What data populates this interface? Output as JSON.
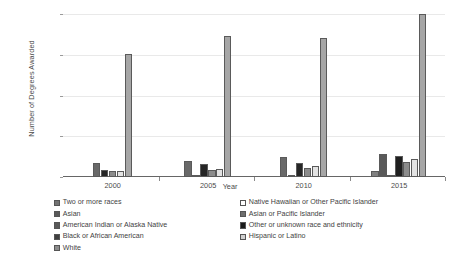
{
  "chart_data": {
    "type": "bar",
    "title": "",
    "subtitle": "",
    "xlabel": "Year",
    "ylabel": "Number of Degrees Awarded",
    "categories": [
      "2000",
      "2005",
      "2010",
      "2015"
    ],
    "ylim": [
      0,
      20000
    ],
    "yticks": [
      0,
      5000,
      10000,
      15000,
      20000
    ],
    "ytick_labels": [
      "0",
      "5,000",
      "10,000",
      "15,000",
      "20,000"
    ],
    "grid": true,
    "legend_position": "bottom",
    "series": [
      {
        "name": "Two or more races",
        "color": "#808080",
        "values": [
          0,
          0,
          0,
          700
        ]
      },
      {
        "name": "Asian",
        "color": "#696969",
        "values": [
          1700,
          1950,
          2400,
          2850
        ]
      },
      {
        "name": "American Indian or Alaska Native",
        "color": "#d9d9d9",
        "values": [
          120,
          130,
          150,
          200
        ]
      },
      {
        "name": "Black or African American",
        "color": "#1a1a1a",
        "values": [
          850,
          1550,
          1700,
          2600
        ]
      },
      {
        "name": "White",
        "color": "#a6a6a6",
        "values": [
          15100,
          17300,
          17000,
          19950
        ]
      },
      {
        "name": "Native Hawaiian or Other Pacific Islander",
        "color": "#ffffff",
        "values": [
          0,
          0,
          0,
          0
        ]
      },
      {
        "name": "Asian or Pacific Islander",
        "color": "#8c8c8c",
        "values": [
          750,
          900,
          1150,
          1900
        ]
      },
      {
        "name": "Other or unknown race and ethnicity",
        "color": "#1a1a1a",
        "values": [
          0,
          0,
          0,
          0
        ]
      },
      {
        "name": "Hispanic or Latino",
        "color": "#e8e8e8",
        "values": [
          700,
          1000,
          1400,
          2150
        ]
      }
    ],
    "group_bars": [
      {
        "year": "2000",
        "bars": [
          {
            "series": "Asian",
            "value": 1700,
            "color": "#696969"
          },
          {
            "series": "Black or African American",
            "value": 850,
            "color": "#262626"
          },
          {
            "series": "Asian or Pacific Islander",
            "value": 750,
            "color": "#8c8c8c"
          },
          {
            "series": "Hispanic or Latino",
            "value": 700,
            "color": "#e3e3e3"
          },
          {
            "series": "White",
            "value": 15100,
            "color": "#a6a6a6"
          }
        ]
      },
      {
        "year": "2005",
        "bars": [
          {
            "series": "Asian",
            "value": 1950,
            "color": "#696969"
          },
          {
            "series": "American Indian or Alaska Native",
            "value": 130,
            "color": "#d9d9d9"
          },
          {
            "series": "Black or African American",
            "value": 1550,
            "color": "#262626"
          },
          {
            "series": "Asian or Pacific Islander",
            "value": 900,
            "color": "#8c8c8c"
          },
          {
            "series": "Hispanic or Latino",
            "value": 1000,
            "color": "#e3e3e3"
          },
          {
            "series": "White",
            "value": 17300,
            "color": "#a6a6a6"
          }
        ]
      },
      {
        "year": "2010",
        "bars": [
          {
            "series": "Asian",
            "value": 2400,
            "color": "#696969"
          },
          {
            "series": "American Indian or Alaska Native",
            "value": 150,
            "color": "#d9d9d9"
          },
          {
            "series": "Black or African American",
            "value": 1700,
            "color": "#262626"
          },
          {
            "series": "Asian or Pacific Islander",
            "value": 1150,
            "color": "#8c8c8c"
          },
          {
            "series": "Hispanic or Latino",
            "value": 1400,
            "color": "#e3e3e3"
          },
          {
            "series": "White",
            "value": 17000,
            "color": "#a6a6a6"
          }
        ]
      },
      {
        "year": "2015",
        "bars": [
          {
            "series": "Two or more races",
            "value": 700,
            "color": "#808080"
          },
          {
            "series": "Asian",
            "value": 2850,
            "color": "#595959"
          },
          {
            "series": "American Indian or Alaska Native",
            "value": 200,
            "color": "#d9d9d9"
          },
          {
            "series": "Black or African American",
            "value": 2600,
            "color": "#1f1f1f"
          },
          {
            "series": "Asian or Pacific Islander",
            "value": 1900,
            "color": "#8c8c8c"
          },
          {
            "series": "Hispanic or Latino",
            "value": 2150,
            "color": "#e3e3e3"
          },
          {
            "series": "White",
            "value": 19950,
            "color": "#a6a6a6"
          }
        ]
      }
    ],
    "legend": {
      "left_column": [
        {
          "label": "Two or more races",
          "color": "#737373"
        },
        {
          "label": "Asian",
          "color": "#595959"
        },
        {
          "label": "American Indian or Alaska Native",
          "color": "#595959"
        },
        {
          "label": "Black or African American",
          "color": "#404040"
        },
        {
          "label": "White",
          "color": "#8c8c8c"
        }
      ],
      "right_column": [
        {
          "label": "Native Hawaiian or Other Pacific Islander",
          "color": "#ffffff"
        },
        {
          "label": "Asian or Pacific Islander",
          "color": "#6e6e6e"
        },
        {
          "label": "Other or unknown race and ethnicity",
          "color": "#1a1a1a"
        },
        {
          "label": "Hispanic or Latino",
          "color": "#d0d0d0"
        }
      ]
    }
  }
}
